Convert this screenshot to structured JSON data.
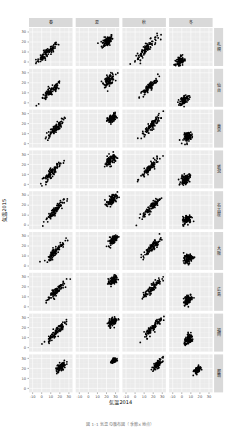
{
  "chart_data": {
    "type": "scatter",
    "title": "",
    "xlabel": "気温2014",
    "ylabel": "気温2015",
    "xlim": [
      -14,
      34
    ],
    "ylim": [
      -4,
      34
    ],
    "x_ticks": [
      -10,
      0,
      10,
      20,
      30
    ],
    "y_ticks": [
      0,
      10,
      20,
      30
    ],
    "grid": true,
    "facet_columns": [
      "春",
      "夏",
      "秋",
      "冬"
    ],
    "facet_rows": [
      "札幌",
      "仙台",
      "東京",
      "新潟",
      "名古屋",
      "大阪",
      "広島",
      "福岡",
      "那覇"
    ],
    "panels": [
      [
        {
          "cx": 6,
          "cy": 9,
          "sx": 6,
          "sy": 5,
          "r": 0.9,
          "n": 90
        },
        {
          "cx": 21,
          "cy": 21,
          "sx": 3,
          "sy": 3,
          "r": 0.5,
          "n": 90
        },
        {
          "cx": 12,
          "cy": 13,
          "sx": 6,
          "sy": 6,
          "r": 0.9,
          "n": 90
        },
        {
          "cx": -2,
          "cy": 0,
          "sx": 3,
          "sy": 3,
          "r": 0.4,
          "n": 90
        }
      ],
      [
        {
          "cx": 10,
          "cy": 11,
          "sx": 6,
          "sy": 5,
          "r": 0.9,
          "n": 90
        },
        {
          "cx": 23,
          "cy": 23,
          "sx": 3,
          "sy": 3,
          "r": 0.5,
          "n": 90
        },
        {
          "cx": 15,
          "cy": 15,
          "sx": 5,
          "sy": 5,
          "r": 0.9,
          "n": 90
        },
        {
          "cx": 3,
          "cy": 3,
          "sx": 2.5,
          "sy": 2.5,
          "r": 0.4,
          "n": 90
        }
      ],
      [
        {
          "cx": 14,
          "cy": 14,
          "sx": 5,
          "sy": 5,
          "r": 0.9,
          "n": 90
        },
        {
          "cx": 26,
          "cy": 25,
          "sx": 2.5,
          "sy": 2.5,
          "r": 0.5,
          "n": 90
        },
        {
          "cx": 18,
          "cy": 18,
          "sx": 5,
          "sy": 5,
          "r": 0.9,
          "n": 90
        },
        {
          "cx": 7,
          "cy": 7,
          "sx": 2.5,
          "sy": 2.5,
          "r": 0.4,
          "n": 90
        }
      ],
      [
        {
          "cx": 11,
          "cy": 12,
          "sx": 5,
          "sy": 5,
          "r": 0.9,
          "n": 90
        },
        {
          "cx": 24,
          "cy": 24,
          "sx": 3,
          "sy": 3,
          "r": 0.5,
          "n": 90
        },
        {
          "cx": 16,
          "cy": 16,
          "sx": 5,
          "sy": 5,
          "r": 0.9,
          "n": 90
        },
        {
          "cx": 4,
          "cy": 5,
          "sx": 2.5,
          "sy": 2.5,
          "r": 0.4,
          "n": 90
        }
      ],
      [
        {
          "cx": 14,
          "cy": 14,
          "sx": 5,
          "sy": 5,
          "r": 0.9,
          "n": 90
        },
        {
          "cx": 26,
          "cy": 25,
          "sx": 3,
          "sy": 3,
          "r": 0.5,
          "n": 90
        },
        {
          "cx": 18,
          "cy": 18,
          "sx": 5,
          "sy": 5,
          "r": 0.9,
          "n": 90
        },
        {
          "cx": 6,
          "cy": 6,
          "sx": 2.5,
          "sy": 2.5,
          "r": 0.4,
          "n": 90
        }
      ],
      [
        {
          "cx": 15,
          "cy": 15,
          "sx": 5,
          "sy": 5,
          "r": 0.9,
          "n": 90
        },
        {
          "cx": 27,
          "cy": 26,
          "sx": 2.5,
          "sy": 2.5,
          "r": 0.5,
          "n": 90
        },
        {
          "cx": 19,
          "cy": 19,
          "sx": 5,
          "sy": 5,
          "r": 0.9,
          "n": 90
        },
        {
          "cx": 7,
          "cy": 7,
          "sx": 2.5,
          "sy": 2.5,
          "r": 0.4,
          "n": 90
        }
      ],
      [
        {
          "cx": 15,
          "cy": 15,
          "sx": 5,
          "sy": 5,
          "r": 0.9,
          "n": 90
        },
        {
          "cx": 27,
          "cy": 26,
          "sx": 2.5,
          "sy": 2.5,
          "r": 0.5,
          "n": 90
        },
        {
          "cx": 19,
          "cy": 19,
          "sx": 5,
          "sy": 5,
          "r": 0.9,
          "n": 90
        },
        {
          "cx": 7,
          "cy": 7,
          "sx": 2.5,
          "sy": 2.5,
          "r": 0.4,
          "n": 90
        }
      ],
      [
        {
          "cx": 15,
          "cy": 15,
          "sx": 5,
          "sy": 5,
          "r": 0.9,
          "n": 90
        },
        {
          "cx": 27,
          "cy": 26,
          "sx": 2.5,
          "sy": 2.5,
          "r": 0.5,
          "n": 90
        },
        {
          "cx": 20,
          "cy": 20,
          "sx": 5,
          "sy": 5,
          "r": 0.9,
          "n": 90
        },
        {
          "cx": 8,
          "cy": 8,
          "sx": 2.5,
          "sy": 2.5,
          "r": 0.4,
          "n": 90
        }
      ],
      [
        {
          "cx": 21,
          "cy": 21,
          "sx": 3,
          "sy": 3,
          "r": 0.7,
          "n": 90
        },
        {
          "cx": 28,
          "cy": 28,
          "sx": 1.2,
          "sy": 1.0,
          "r": 0.4,
          "n": 90
        },
        {
          "cx": 25,
          "cy": 24,
          "sx": 2.5,
          "sy": 2.5,
          "r": 0.7,
          "n": 90
        },
        {
          "cx": 17,
          "cy": 18,
          "sx": 1.8,
          "sy": 1.8,
          "r": 0.4,
          "n": 90
        }
      ]
    ]
  },
  "caption": "図 1-1  気温の散布図（季節×地点）"
}
